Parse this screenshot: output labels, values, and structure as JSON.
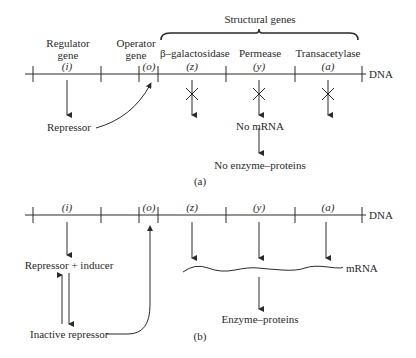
{
  "panel_a": {
    "caption": "(a)",
    "header": {
      "regulator_gene": [
        "Regulator",
        "gene"
      ],
      "operator_gene": [
        "Operator",
        "gene"
      ],
      "structural_genes": "Structural genes",
      "beta_galactosidase": "β–galactosidase",
      "permease": "Permease",
      "transacetylase": "Transacetylase"
    },
    "gene_symbols": {
      "i": "(i)",
      "o": "(o)",
      "z": "(z)",
      "y": "(y)",
      "a": "(a)"
    },
    "dna_label": "DNA",
    "repressor": "Repressor",
    "no_mrna": "No mRNA",
    "no_enzyme_proteins": "No enzyme–proteins"
  },
  "panel_b": {
    "caption": "(b)",
    "gene_symbols": {
      "i": "(i)",
      "o": "(o)",
      "z": "(z)",
      "y": "(y)",
      "a": "(a)"
    },
    "dna_label": "DNA",
    "repressor_inducer": "Repressor + inducer",
    "inactive_repressor": "Inactive repressor",
    "mrna": "mRNA",
    "enzyme_proteins": "Enzyme–proteins"
  },
  "colors": {
    "ink": "#2a2a2a",
    "background": "#ffffff"
  }
}
